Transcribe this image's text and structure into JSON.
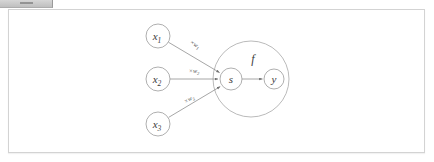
{
  "window": {
    "toolbar_fragment": "toolbar-fragment"
  },
  "figure": {
    "colors": {
      "stroke": "#9b9b9b",
      "group_stroke": "#a8a8a8",
      "edge": "#8f8f8f",
      "text": "#3a3a3a",
      "weight_text": "#555555",
      "page_border": "#d3d3d3",
      "page_background": "#ffffff"
    },
    "inputs": [
      {
        "id": "x1",
        "base": "x",
        "sub": "1",
        "cx": 158,
        "cy": 36,
        "r": 12
      },
      {
        "id": "x2",
        "base": "x",
        "sub": "2",
        "cx": 158,
        "cy": 79,
        "r": 12
      },
      {
        "id": "x3",
        "base": "x",
        "sub": "3",
        "cx": 158,
        "cy": 124,
        "r": 12
      }
    ],
    "weights": [
      {
        "id": "w1",
        "symbol": "×",
        "base": "w",
        "sub": "1",
        "x": 194,
        "y": 46
      },
      {
        "id": "w2",
        "symbol": "×",
        "base": "w",
        "sub": "2",
        "x": 194,
        "y": 73
      },
      {
        "id": "w3",
        "symbol": "×",
        "base": "w",
        "sub": "3",
        "x": 190,
        "y": 101
      }
    ],
    "sum_node": {
      "id": "s",
      "label": "s",
      "cx": 231,
      "cy": 79,
      "r": 11
    },
    "output_node": {
      "id": "y",
      "label": "y",
      "cx": 274,
      "cy": 79,
      "r": 10
    },
    "group": {
      "id": "f",
      "label": "f",
      "cx": 251,
      "cy": 79,
      "r": 38,
      "label_x": 253,
      "label_y": 63
    }
  }
}
